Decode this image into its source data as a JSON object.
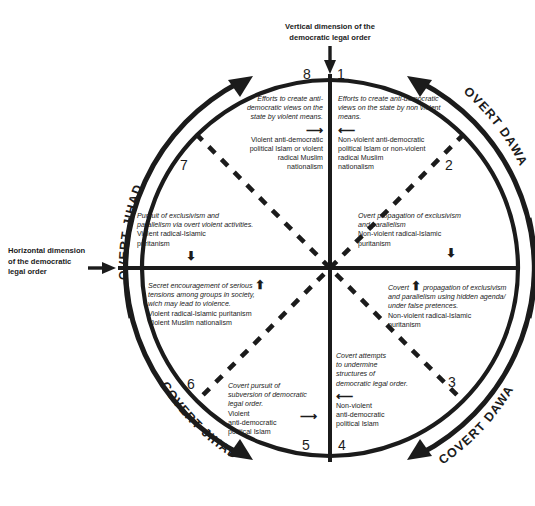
{
  "diagram": {
    "title_vertical_axis": "Vertical dimension of the\ndemocratic legal order",
    "vertical_axis_line1": "Vertical dimension of the",
    "vertical_axis_line2": "democratic legal order",
    "horizontal_axis_line1": "Horizontal dimension",
    "horizontal_axis_line2": "of the democratic",
    "horizontal_axis_line3": "legal order",
    "outer_labels": [
      {
        "name": "overt-jihad",
        "text": "OVERT JIHAD"
      },
      {
        "name": "overt-dawa",
        "text": "OVERT DAWA"
      },
      {
        "name": "covert-dawa",
        "text": "COVERT DAWA"
      },
      {
        "name": "covert-jihad",
        "text": "COVERT JIHAD"
      }
    ],
    "segment_numbers": [
      "1",
      "2",
      "3",
      "4",
      "5",
      "6",
      "7",
      "8"
    ],
    "segments": [
      {
        "number": "1",
        "lead": "Efforts to create anti-democratic views on the state by non violent means.",
        "arrow": "left",
        "body": "Non-violent anti-democratic political Islam or non-violent radical Muslim nationalism"
      },
      {
        "number": "2",
        "lead": "Overt propagation of exclusivism and parallelism",
        "arrow": "down",
        "body": "Non-violent radical-Islamic puritanism"
      },
      {
        "number": "3",
        "lead": "Covert propagation of exclusivism and parallelism using hidden agenda/ under false pretences.",
        "arrow": "up",
        "body": "Non-violent radical-Islamic puritanism"
      },
      {
        "number": "4",
        "lead": "Covert attempts to undermine structures of democratic legal order.",
        "arrow": "left",
        "body": "Non-violent anti-democratic political Islam"
      },
      {
        "number": "5",
        "lead": "Covert pursuit of subversion of democratic legal order.",
        "arrow": "right",
        "body": "Violent anti-democratic political Islam"
      },
      {
        "number": "6",
        "lead": "Secret encouragement of serious tensions among groups in society, wich may lead to violence.",
        "arrow": "up",
        "body": "Violent radical-Islamic puritanism Violent Muslim nationalism"
      },
      {
        "number": "7",
        "lead": "Pursuit of exclusivism and parallelism via overt violent activities.",
        "arrow": "down",
        "body": "Violent radical-Islamic puritanism"
      },
      {
        "number": "8",
        "lead": "Efforts to create anti-democratic views on the state by violent means.",
        "arrow": "right",
        "body": "Violent anti-democratic political Islam or violent radical Muslim nationalism"
      }
    ],
    "seg1": {
      "lead_l1": "Efforts to create anti-democratic",
      "lead_l2": "views on the state by non violent",
      "lead_l3": "means.",
      "body_l1": "Non-violent anti-democratic",
      "body_l2": "political Islam or non-violent",
      "body_l3": "radical Muslim",
      "body_l4": "nationalism"
    },
    "seg8": {
      "lead_l1": "Efforts to create anti-",
      "lead_l2": "democratic views on the",
      "lead_l3": "state by violent means.",
      "body_l1": "Violent anti-democratic",
      "body_l2": "political Islam or violent",
      "body_l3": "radical Muslim",
      "body_l4": "nationalism"
    },
    "seg2": {
      "lead_l1": "Overt propagation of exclusivism",
      "lead_l2": "and parallelism",
      "body_l1": "Non-violent radical-Islamic",
      "body_l2": "puritanism"
    },
    "seg7": {
      "lead_l1": "Pursuit of exclusivism and",
      "lead_l2": "parallelism via overt violent activities.",
      "body_l1": "Violent radical-Islamic",
      "body_l2": "puritanism"
    },
    "seg3": {
      "lead_l1": "propagation of exclusivism",
      "lead_pre": "Covert",
      "lead_l2": "and parallelism using hidden agenda/",
      "lead_l3": "under false pretences.",
      "body_l1": "Non-violent radical-Islamic",
      "body_l2": "puritanism"
    },
    "seg6": {
      "lead_l1": "Secret encouragement of serious",
      "lead_l2": "tensions among groups in society,",
      "lead_l3": "wich may lead to violence.",
      "body_l1": "Violent radical-Islamic puritanism",
      "body_l2": "Violent Muslim nationalism"
    },
    "seg4": {
      "lead_l1": "Covert attempts",
      "lead_l2": "to undermine",
      "lead_l3": "structures of",
      "lead_l4": "democratic legal order.",
      "body_l1": "Non-violent",
      "body_l2": "anti-democratic",
      "body_l3": "political Islam"
    },
    "seg5": {
      "lead_l1": "Covert pursuit of",
      "lead_l2": "subversion of democratic",
      "lead_l3": "legal order.",
      "body_l1": "Violent",
      "body_l2": "anti-democratic",
      "body_l3": "political Islam"
    },
    "colors": {
      "ink": "#1b1b1b",
      "background": "#ffffff"
    }
  }
}
